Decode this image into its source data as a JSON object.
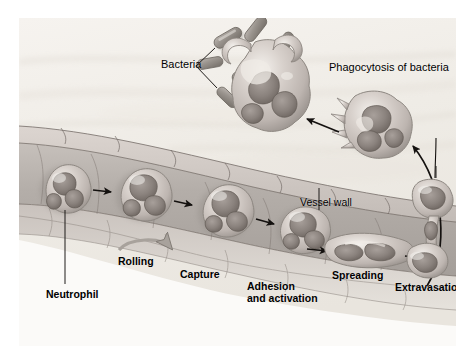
{
  "figure": {
    "width": 472,
    "height": 363,
    "background_color": "#ffffff",
    "plate_background_color": "#f2efea"
  },
  "labels": {
    "bacteria": "Bacteria",
    "phagocytosis": "Phagocytosis of bacteria",
    "vessel_wall": "Vessel wall",
    "neutrophil": "Neutrophil",
    "rolling": "Rolling",
    "capture": "Capture",
    "adhesion_line1": "Adhesion",
    "adhesion_line2": "and activation",
    "spreading": "Spreading",
    "extravasation": "Extravasation"
  },
  "colors": {
    "plasma": "#efece6",
    "vessel_lumen": "#b8b2ae",
    "vessel_wall_top": "#cfc8c3",
    "endothelium_line": "#6e6560",
    "tissue_below": "#ffffff",
    "cell_body": "#cfc7c2",
    "cell_nucleus": "#8b8480",
    "cell_highlight": "#f3f0ec",
    "bacteria_body": "#9a9490",
    "arrow": "#14110f",
    "label_text": "#000000"
  },
  "sequence": {
    "steps": [
      "Neutrophil",
      "Rolling",
      "Capture",
      "Adhesion and activation",
      "Spreading",
      "Extravasation",
      "Phagocytosis of bacteria"
    ],
    "step_count": 7
  },
  "elements": {
    "bacteria_count": 9,
    "neutrophils_in_vessel": 5,
    "neutrophils_outside_vessel": 3,
    "straight_arrows": 6,
    "curved_arrows": 2,
    "leader_lines": 4
  }
}
